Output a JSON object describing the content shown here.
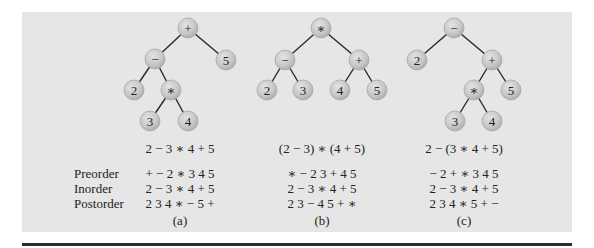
{
  "figure": {
    "row_labels": [
      "Preorder",
      "Inorder",
      "Postorder"
    ],
    "panels": [
      {
        "caption": "(a)",
        "expression": "2 − 3 ∗ 4 + 5",
        "preorder": "+ − 2 ∗ 3 4 5",
        "inorder": "2 − 3 ∗ 4 + 5",
        "postorder": "2 3 4 ∗ − 5 +",
        "nodes": [
          {
            "id": "a0",
            "label": "+",
            "x": 188,
            "y": 28
          },
          {
            "id": "a1",
            "label": "−",
            "x": 155,
            "y": 59
          },
          {
            "id": "a2",
            "label": "5",
            "x": 226,
            "y": 60
          },
          {
            "id": "a3",
            "label": "2",
            "x": 134,
            "y": 90
          },
          {
            "id": "a4",
            "label": "∗",
            "x": 171,
            "y": 90
          },
          {
            "id": "a5",
            "label": "3",
            "x": 150,
            "y": 121
          },
          {
            "id": "a6",
            "label": "4",
            "x": 188,
            "y": 121
          }
        ],
        "edges": [
          [
            "a0",
            "a1"
          ],
          [
            "a0",
            "a2"
          ],
          [
            "a1",
            "a3"
          ],
          [
            "a1",
            "a4"
          ],
          [
            "a4",
            "a5"
          ],
          [
            "a4",
            "a6"
          ]
        ]
      },
      {
        "caption": "(b)",
        "expression": "(2 − 3) ∗ (4 + 5)",
        "preorder": "∗ − 2 3 + 4 5",
        "inorder": "2 − 3 ∗ 4 + 5",
        "postorder": "2 3 − 4 5 + ∗",
        "nodes": [
          {
            "id": "b0",
            "label": "∗",
            "x": 321,
            "y": 28
          },
          {
            "id": "b1",
            "label": "−",
            "x": 285,
            "y": 60
          },
          {
            "id": "b2",
            "label": "+",
            "x": 359,
            "y": 60
          },
          {
            "id": "b3",
            "label": "2",
            "x": 267,
            "y": 90
          },
          {
            "id": "b4",
            "label": "3",
            "x": 303,
            "y": 90
          },
          {
            "id": "b5",
            "label": "4",
            "x": 340,
            "y": 90
          },
          {
            "id": "b6",
            "label": "5",
            "x": 377,
            "y": 90
          }
        ],
        "edges": [
          [
            "b0",
            "b1"
          ],
          [
            "b0",
            "b2"
          ],
          [
            "b1",
            "b3"
          ],
          [
            "b1",
            "b4"
          ],
          [
            "b2",
            "b5"
          ],
          [
            "b2",
            "b6"
          ]
        ]
      },
      {
        "caption": "(c)",
        "expression": "2 − (3 ∗ 4 + 5)",
        "preorder": "− 2 + ∗ 3 4 5",
        "inorder": "2 − 3 ∗ 4 + 5",
        "postorder": "2 3 4 ∗ 5 + −",
        "nodes": [
          {
            "id": "c0",
            "label": "−",
            "x": 454,
            "y": 28
          },
          {
            "id": "c1",
            "label": "2",
            "x": 417,
            "y": 60
          },
          {
            "id": "c2",
            "label": "+",
            "x": 492,
            "y": 60
          },
          {
            "id": "c3",
            "label": "∗",
            "x": 474,
            "y": 90
          },
          {
            "id": "c4",
            "label": "5",
            "x": 511,
            "y": 90
          },
          {
            "id": "c5",
            "label": "3",
            "x": 455,
            "y": 121
          },
          {
            "id": "c6",
            "label": "4",
            "x": 492,
            "y": 121
          }
        ],
        "edges": [
          [
            "c0",
            "c1"
          ],
          [
            "c0",
            "c2"
          ],
          [
            "c2",
            "c3"
          ],
          [
            "c2",
            "c4"
          ],
          [
            "c3",
            "c5"
          ],
          [
            "c3",
            "c6"
          ]
        ]
      }
    ],
    "colors": {
      "panel_bg": "#e6e6e6",
      "node_fill": "#c8c8c8",
      "node_stroke": "#a8a8a8",
      "edge": "#2a2a2a",
      "text": "#222222",
      "rule": "#2a2a2a"
    }
  }
}
